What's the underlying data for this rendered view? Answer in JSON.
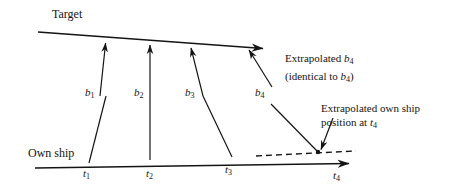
{
  "figure": {
    "type": "line-diagram",
    "background": "#ffffff",
    "stroke": "#141414",
    "labels": {
      "target": "Target",
      "own_ship": "Own ship",
      "b1": "b",
      "b1_sub": "1",
      "b2": "b",
      "b2_sub": "2",
      "b3": "b",
      "b3_sub": "3",
      "b4": "b",
      "b4_sub": "4",
      "t1": "t",
      "t1_sub": "1",
      "t2": "t",
      "t2_sub": "2",
      "t3": "t",
      "t3_sub": "3",
      "t4": "t",
      "t4_sub": "4",
      "extrap_b4_line1_pre": "Extrapolated ",
      "extrap_b4_line1_var": "b",
      "extrap_b4_line1_sub": "4",
      "extrap_b4_line2_pre": "(identical to ",
      "extrap_b4_line2_var": "b",
      "extrap_b4_line2_sub": "4",
      "extrap_b4_line2_post": ")",
      "extrap_own_line1": "Extrapolated own ship",
      "extrap_own_line2_pre": "position at ",
      "extrap_own_line2_var": "t",
      "extrap_own_line2_sub": "4"
    },
    "geometry": {
      "target_line": {
        "x1": 38,
        "y1": 32,
        "x2": 265,
        "y2": 49,
        "arrow": "end"
      },
      "own_ship_line": {
        "x1": 35,
        "y1": 168,
        "x2": 352,
        "y2": 164,
        "arrow": "end"
      },
      "dashed_line": {
        "x1": 256,
        "y1": 156,
        "x2": 356,
        "y2": 151,
        "style": "dashed"
      },
      "bearings": [
        {
          "name": "b1",
          "x1": 100,
          "y1": 96,
          "x2": 106,
          "y2": 40,
          "arrow": "end"
        },
        {
          "name": "b2",
          "x1": 150,
          "y1": 96,
          "x2": 150,
          "y2": 42,
          "arrow": "end"
        },
        {
          "name": "b3",
          "x1": 203,
          "y1": 96,
          "x2": 190,
          "y2": 45,
          "arrow": "end"
        },
        {
          "name": "b4",
          "x1": 272,
          "y1": 87,
          "x2": 247,
          "y2": 47,
          "arrow": "end"
        }
      ],
      "time_ticks": [
        {
          "name": "t1",
          "x1": 106,
          "y1": 96,
          "x2": 89,
          "y2": 162
        },
        {
          "name": "t2",
          "x1": 150,
          "y1": 96,
          "x2": 150,
          "y2": 159
        },
        {
          "name": "t3",
          "x1": 203,
          "y1": 96,
          "x2": 232,
          "y2": 156
        },
        {
          "name": "t4",
          "x1": 272,
          "y1": 103,
          "x2": 318,
          "y2": 152
        }
      ],
      "callout_arrow": {
        "x1": 332,
        "y1": 119,
        "x2": 318,
        "y2": 152,
        "arrow": "end"
      },
      "intersection_dot": {
        "x": 318,
        "y": 152,
        "r": 2.2
      }
    }
  }
}
